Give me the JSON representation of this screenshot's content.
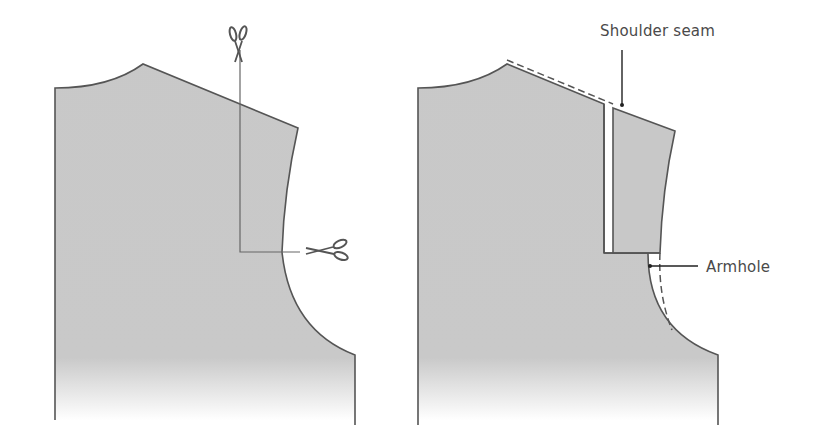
{
  "diagram": {
    "panels": [
      {
        "id": "left",
        "description": "Pattern piece with cutting lines",
        "icons": [
          "scissors-icon-vertical",
          "scissors-icon-horizontal"
        ]
      },
      {
        "id": "right",
        "description": "Pattern piece after spreading shoulder"
      }
    ],
    "labels": {
      "shoulder_seam": "Shoulder seam",
      "armhole": "Armhole"
    },
    "colors": {
      "fill": "#c9c9c9",
      "outline": "#555555",
      "label": "#4a4a4a"
    }
  }
}
